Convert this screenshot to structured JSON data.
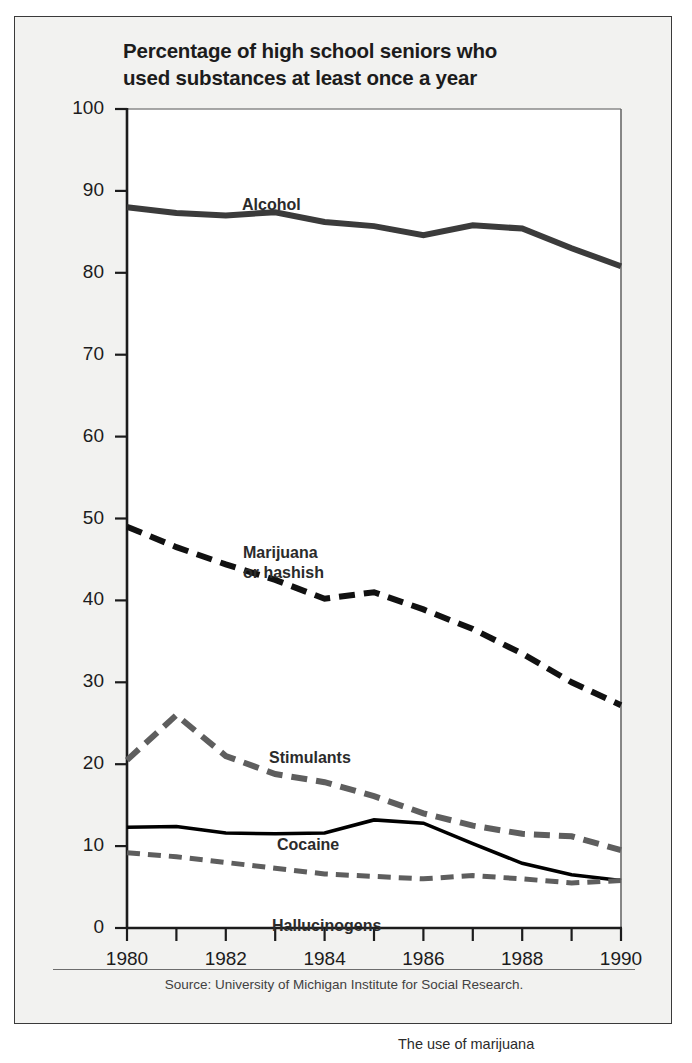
{
  "figure": {
    "title_line1": "Percentage of high school seniors who",
    "title_line2": "used substances at least once a year",
    "source": "Source: University of Michigan Institute for Social Research.",
    "caption_tail": "The use of marijuana"
  },
  "colors": {
    "panel_background": "#f2f2f0",
    "plot_background": "#ffffff",
    "frame": "#3a3a3a",
    "axis": "#1c1c1c",
    "alcohol": "#3b3b3b",
    "marijuana": "#111111",
    "stimulants": "#5e5e5e",
    "cocaine": "#000000",
    "hallucinogens": "#5e5e5e",
    "text": "#1c1c1c",
    "source_text": "#414141"
  },
  "chart_data": {
    "type": "line",
    "title": "Percentage of high school seniors who used substances at least once a year",
    "xlabel": "",
    "ylabel": "",
    "xlim": [
      1980,
      1990
    ],
    "ylim": [
      0,
      100
    ],
    "ytick_values": [
      0,
      10,
      20,
      30,
      40,
      50,
      60,
      70,
      80,
      90,
      100
    ],
    "ytick_labels": [
      "0",
      "10",
      "20",
      "30",
      "40",
      "50",
      "60",
      "70",
      "80",
      "90",
      "100"
    ],
    "xtick_values": [
      1980,
      1981,
      1982,
      1983,
      1984,
      1985,
      1986,
      1987,
      1988,
      1989,
      1990
    ],
    "xtick_labels_shown": [
      "1980",
      "1982",
      "1984",
      "1986",
      "1988",
      "1990"
    ],
    "xtick_label_values": [
      1980,
      1982,
      1984,
      1986,
      1988,
      1990
    ],
    "grid": false,
    "legend": "inline-labels",
    "x": [
      1980,
      1981,
      1982,
      1983,
      1984,
      1985,
      1986,
      1987,
      1988,
      1989,
      1990
    ],
    "series": [
      {
        "name": "Alcohol",
        "label_line1": "Alcohol",
        "label_line2": "",
        "style": "solid",
        "width": 6,
        "color": "#3b3b3b",
        "values": [
          88.0,
          87.3,
          87.0,
          87.4,
          86.2,
          85.7,
          84.6,
          85.8,
          85.4,
          83.0,
          80.8
        ]
      },
      {
        "name": "Marijuana or hashish",
        "label_line1": "Marijuana",
        "label_line2": "or hashish",
        "style": "dashed",
        "width": 6,
        "color": "#111111",
        "values": [
          49.0,
          46.5,
          44.4,
          42.5,
          40.2,
          41.0,
          38.9,
          36.5,
          33.5,
          30.0,
          27.2
        ]
      },
      {
        "name": "Stimulants",
        "label_line1": "Stimulants",
        "label_line2": "",
        "style": "dashed",
        "width": 6,
        "color": "#5e5e5e",
        "values": [
          20.5,
          26.0,
          21.0,
          18.8,
          17.8,
          16.1,
          14.0,
          12.5,
          11.5,
          11.2,
          9.5
        ]
      },
      {
        "name": "Cocaine",
        "label_line1": "Cocaine",
        "label_line2": "",
        "style": "solid",
        "width": 3.6,
        "color": "#000000",
        "values": [
          12.3,
          12.4,
          11.6,
          11.5,
          11.6,
          13.2,
          12.8,
          10.3,
          7.9,
          6.5,
          5.8
        ]
      },
      {
        "name": "Hallucinogens",
        "label_line1": "Hallucinogens",
        "label_line2": "",
        "style": "dashed",
        "width": 5,
        "color": "#5e5e5e",
        "values": [
          9.2,
          8.7,
          8.0,
          7.3,
          6.6,
          6.3,
          6.0,
          6.4,
          6.0,
          5.5,
          5.8
        ]
      }
    ],
    "series_label_positions": [
      {
        "name": "Alcohol",
        "x_px": 227,
        "y_px": 178
      },
      {
        "name": "Marijuana or hashish",
        "x_px": 228,
        "y_px": 526
      },
      {
        "name": "Stimulants",
        "x_px": 254,
        "y_px": 731
      },
      {
        "name": "Cocaine",
        "x_px": 262,
        "y_px": 818
      },
      {
        "name": "Hallucinogens",
        "x_px": 257,
        "y_px": 899
      }
    ]
  }
}
